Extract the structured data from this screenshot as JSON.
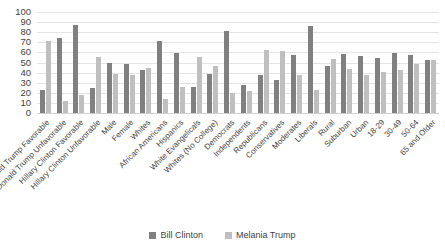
{
  "chart_data": {
    "type": "bar",
    "title": "",
    "subtitle": "",
    "xlabel": "",
    "ylabel": "",
    "ylim": [
      0,
      100
    ],
    "yticks": [
      100,
      90,
      80,
      70,
      60,
      50,
      40,
      30,
      20,
      10,
      0
    ],
    "grid": true,
    "legend_position": "bottom",
    "categories": [
      "Donald Trump Favorable",
      "Donald Trump Unfavorable",
      "Hillary Clinton Favorable",
      "Hillary Clinton Unfavorable",
      "Male",
      "Female",
      "Whites",
      "African Americans",
      "Hispanics",
      "White Evangelicals",
      "Whites (No College)",
      "Democrats",
      "Independents",
      "Republicans",
      "Conservatives",
      "Moderates",
      "Liberals",
      "Rural",
      "Suburban",
      "Urban",
      "18-29",
      "30-49",
      "50-64",
      "65 and Older"
    ],
    "series": [
      {
        "name": "Bill Clinton",
        "color": "#808080",
        "values": [
          23,
          74,
          87,
          25,
          50,
          49,
          43,
          71,
          59,
          26,
          39,
          81,
          28,
          38,
          33,
          57,
          86,
          47,
          58,
          56,
          54,
          59,
          57,
          52
        ]
      },
      {
        "name": "Melania Trump",
        "color": "#bfbfbf",
        "values": [
          71,
          12,
          18,
          55,
          39,
          38,
          45,
          14,
          26,
          55,
          47,
          20,
          22,
          62,
          61,
          38,
          23,
          53,
          44,
          38,
          41,
          43,
          49,
          52
        ]
      }
    ]
  },
  "legend": {
    "items": [
      {
        "label": "Bill Clinton",
        "color": "#808080"
      },
      {
        "label": "Melania Trump",
        "color": "#bfbfbf"
      }
    ]
  }
}
